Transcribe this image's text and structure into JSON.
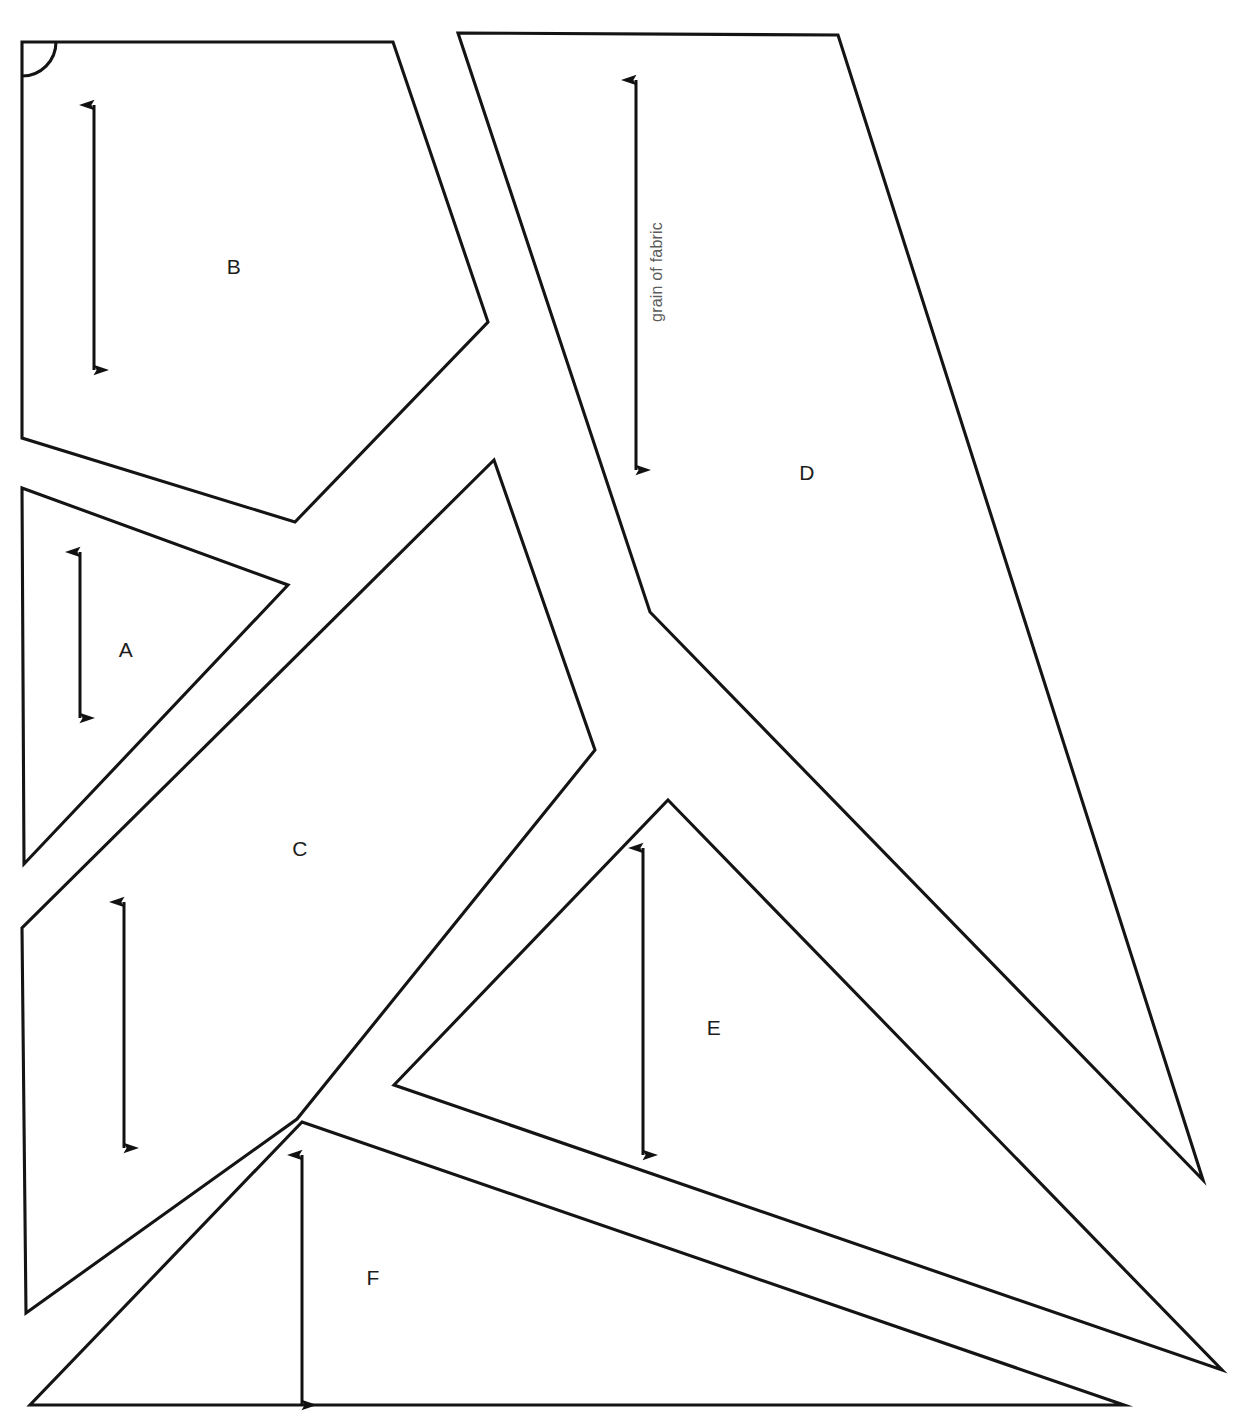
{
  "document": {
    "type": "sewing-pattern-cutting-layout",
    "title_fragment": "",
    "background_color": "#ffffff",
    "line_color": "#141414",
    "label_color": "#1c1c1c",
    "grain_label_color": "#5c5c5c",
    "width": 1250,
    "height": 1425
  },
  "markers": {
    "fold_corner": {
      "name": "fold-corner-arc",
      "x": 22,
      "y": 42,
      "radius": 34
    }
  },
  "grain_label": {
    "text": "grain of fabric",
    "x": 662,
    "y": 272,
    "rotation": -90
  },
  "pieces": [
    {
      "id": "A",
      "label": "A",
      "label_x": 126,
      "label_y": 651,
      "points": "22,488 288,585 24,864",
      "grain": {
        "x1": 80,
        "y1": 552,
        "x2": 80,
        "y2": 718,
        "double_headed": true,
        "labeled": false
      }
    },
    {
      "id": "B",
      "label": "B",
      "label_x": 234,
      "label_y": 268,
      "points": "22,42 393,42 488,322 295,522 22,438",
      "grain": {
        "x1": 94,
        "y1": 105,
        "x2": 94,
        "y2": 370,
        "double_headed": true,
        "labeled": false
      }
    },
    {
      "id": "C",
      "label": "C",
      "label_x": 300,
      "label_y": 850,
      "points": "494,460 595,750 297,1119 26,1313 22,928",
      "grain": {
        "x1": 124,
        "y1": 902,
        "x2": 124,
        "y2": 1148,
        "double_headed": true,
        "labeled": false
      }
    },
    {
      "id": "D",
      "label": "D",
      "label_x": 807,
      "label_y": 474,
      "points": "458,33 838,35 1203,1180 650,612",
      "grain": {
        "x1": 636,
        "y1": 80,
        "x2": 636,
        "y2": 470,
        "double_headed": true,
        "labeled": true
      }
    },
    {
      "id": "E",
      "label": "E",
      "label_x": 714,
      "label_y": 1029,
      "points": "668,800 1222,1370 394,1085",
      "grain": {
        "x1": 643,
        "y1": 848,
        "x2": 643,
        "y2": 1155,
        "double_headed": true,
        "labeled": false
      }
    },
    {
      "id": "F",
      "label": "F",
      "label_x": 373,
      "label_y": 1279,
      "points": "302,1122 1124,1405 30,1405",
      "grain": {
        "x1": 302,
        "y1": 1155,
        "x2": 302,
        "y2": 1405,
        "double_headed": true,
        "labeled": false
      }
    }
  ]
}
